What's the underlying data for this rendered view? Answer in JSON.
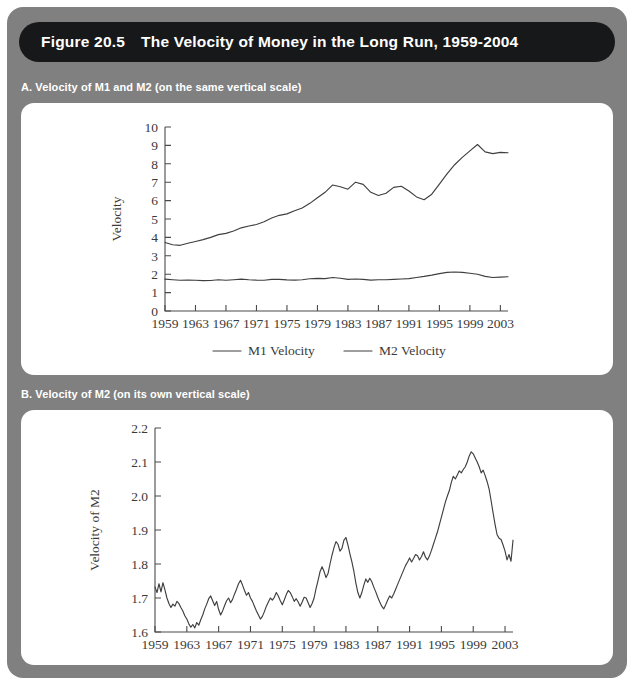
{
  "figure": {
    "number": "Figure 20.5",
    "title": "The Velocity of Money in the Long Run, 1959-2004",
    "panel_a_caption": "A. Velocity of M1 and M2 (on the same vertical scale)",
    "panel_b_caption": "B. Velocity of M2 (on its own vertical scale)",
    "colors": {
      "card_background": "#808080",
      "title_bar": "#16181a",
      "panel_background": "#ffffff",
      "line": "#3f3f3f",
      "caption_text": "#ffffff"
    }
  },
  "chart_data": [
    {
      "type": "line",
      "id": "panel-a",
      "title": "A. Velocity of M1 and M2 (on the same vertical scale)",
      "xlabel": "",
      "ylabel": "Velocity",
      "xlim": [
        1959,
        2004
      ],
      "ylim": [
        0,
        10
      ],
      "grid": false,
      "legend_position": "bottom",
      "xticks": [
        1959,
        1963,
        1967,
        1971,
        1975,
        1979,
        1983,
        1987,
        1991,
        1995,
        1999,
        2003
      ],
      "yticks": [
        0,
        1,
        2,
        3,
        4,
        5,
        6,
        7,
        8,
        9,
        10
      ],
      "x": [
        1959,
        1960,
        1961,
        1962,
        1963,
        1964,
        1965,
        1966,
        1967,
        1968,
        1969,
        1970,
        1971,
        1972,
        1973,
        1974,
        1975,
        1976,
        1977,
        1978,
        1979,
        1980,
        1981,
        1982,
        1983,
        1984,
        1985,
        1986,
        1987,
        1988,
        1989,
        1990,
        1991,
        1992,
        1993,
        1994,
        1995,
        1996,
        1997,
        1998,
        1999,
        2000,
        2001,
        2002,
        2003,
        2004
      ],
      "series": [
        {
          "name": "M1 Velocity",
          "values": [
            3.72,
            3.6,
            3.57,
            3.68,
            3.78,
            3.88,
            4.0,
            4.15,
            4.22,
            4.35,
            4.52,
            4.62,
            4.7,
            4.85,
            5.05,
            5.2,
            5.28,
            5.45,
            5.6,
            5.85,
            6.15,
            6.45,
            6.85,
            6.75,
            6.62,
            7.0,
            6.88,
            6.45,
            6.28,
            6.4,
            6.72,
            6.78,
            6.52,
            6.2,
            6.05,
            6.35,
            6.9,
            7.45,
            7.95,
            8.35,
            8.7,
            9.05,
            8.65,
            8.55,
            8.62,
            8.6
          ]
        },
        {
          "name": "M2 Velocity",
          "values": [
            1.73,
            1.7,
            1.67,
            1.68,
            1.67,
            1.65,
            1.66,
            1.7,
            1.67,
            1.7,
            1.73,
            1.7,
            1.68,
            1.67,
            1.72,
            1.72,
            1.69,
            1.68,
            1.7,
            1.75,
            1.77,
            1.76,
            1.82,
            1.78,
            1.72,
            1.74,
            1.72,
            1.68,
            1.7,
            1.7,
            1.72,
            1.74,
            1.76,
            1.82,
            1.88,
            1.95,
            2.03,
            2.1,
            2.12,
            2.1,
            2.05,
            2.0,
            1.88,
            1.82,
            1.84,
            1.86
          ]
        }
      ]
    },
    {
      "type": "line",
      "id": "panel-b",
      "title": "B. Velocity of M2 (on its own vertical scale)",
      "xlabel": "",
      "ylabel": "Velocity of M2",
      "xlim": [
        1959,
        2004
      ],
      "ylim": [
        1.6,
        2.2
      ],
      "grid": false,
      "legend_position": "none",
      "xticks": [
        1959,
        1963,
        1967,
        1971,
        1975,
        1979,
        1983,
        1987,
        1991,
        1995,
        1999,
        2003
      ],
      "yticks": [
        "1.6",
        "1.7",
        "1.8",
        "1.9",
        "2.0",
        "2.1",
        "2.2"
      ],
      "x": [
        1959.0,
        1959.25,
        1959.5,
        1959.75,
        1960.0,
        1960.25,
        1960.5,
        1960.75,
        1961.0,
        1961.25,
        1961.5,
        1961.75,
        1962.0,
        1962.25,
        1962.5,
        1962.75,
        1963.0,
        1963.25,
        1963.5,
        1963.75,
        1964.0,
        1964.25,
        1964.5,
        1964.75,
        1965.0,
        1965.25,
        1965.5,
        1965.75,
        1966.0,
        1966.25,
        1966.5,
        1966.75,
        1967.0,
        1967.25,
        1967.5,
        1967.75,
        1968.0,
        1968.25,
        1968.5,
        1968.75,
        1969.0,
        1969.25,
        1969.5,
        1969.75,
        1970.0,
        1970.25,
        1970.5,
        1970.75,
        1971.0,
        1971.25,
        1971.5,
        1971.75,
        1972.0,
        1972.25,
        1972.5,
        1972.75,
        1973.0,
        1973.25,
        1973.5,
        1973.75,
        1974.0,
        1974.25,
        1974.5,
        1974.75,
        1975.0,
        1975.25,
        1975.5,
        1975.75,
        1976.0,
        1976.25,
        1976.5,
        1976.75,
        1977.0,
        1977.25,
        1977.5,
        1977.75,
        1978.0,
        1978.25,
        1978.5,
        1978.75,
        1979.0,
        1979.25,
        1979.5,
        1979.75,
        1980.0,
        1980.25,
        1980.5,
        1980.75,
        1981.0,
        1981.25,
        1981.5,
        1981.75,
        1982.0,
        1982.25,
        1982.5,
        1982.75,
        1983.0,
        1983.25,
        1983.5,
        1983.75,
        1984.0,
        1984.25,
        1984.5,
        1984.75,
        1985.0,
        1985.25,
        1985.5,
        1985.75,
        1986.0,
        1986.25,
        1986.5,
        1986.75,
        1987.0,
        1987.25,
        1987.5,
        1987.75,
        1988.0,
        1988.25,
        1988.5,
        1988.75,
        1989.0,
        1989.25,
        1989.5,
        1989.75,
        1990.0,
        1990.25,
        1990.5,
        1990.75,
        1991.0,
        1991.25,
        1991.5,
        1991.75,
        1992.0,
        1992.25,
        1992.5,
        1992.75,
        1993.0,
        1993.25,
        1993.5,
        1993.75,
        1994.0,
        1994.25,
        1994.5,
        1994.75,
        1995.0,
        1995.25,
        1995.5,
        1995.75,
        1996.0,
        1996.25,
        1996.5,
        1996.75,
        1997.0,
        1997.25,
        1997.5,
        1997.75,
        1998.0,
        1998.25,
        1998.5,
        1998.75,
        1999.0,
        1999.25,
        1999.5,
        1999.75,
        2000.0,
        2000.25,
        2000.5,
        2000.75,
        2001.0,
        2001.25,
        2001.5,
        2001.75,
        2002.0,
        2002.25,
        2002.5,
        2002.75,
        2003.0,
        2003.25,
        2003.5,
        2003.75,
        2004.0
      ],
      "series": [
        {
          "name": "Velocity of M2",
          "values": [
            1.732,
            1.716,
            1.742,
            1.718,
            1.745,
            1.724,
            1.7,
            1.684,
            1.672,
            1.682,
            1.676,
            1.69,
            1.684,
            1.672,
            1.662,
            1.648,
            1.638,
            1.624,
            1.614,
            1.622,
            1.612,
            1.628,
            1.62,
            1.636,
            1.65,
            1.668,
            1.682,
            1.698,
            1.706,
            1.692,
            1.678,
            1.69,
            1.666,
            1.65,
            1.662,
            1.678,
            1.692,
            1.7,
            1.686,
            1.696,
            1.712,
            1.726,
            1.742,
            1.752,
            1.738,
            1.722,
            1.708,
            1.716,
            1.7,
            1.69,
            1.676,
            1.662,
            1.65,
            1.638,
            1.646,
            1.66,
            1.676,
            1.688,
            1.7,
            1.694,
            1.702,
            1.716,
            1.706,
            1.692,
            1.68,
            1.694,
            1.71,
            1.722,
            1.716,
            1.704,
            1.69,
            1.698,
            1.688,
            1.676,
            1.688,
            1.702,
            1.7,
            1.686,
            1.672,
            1.684,
            1.7,
            1.728,
            1.752,
            1.778,
            1.792,
            1.778,
            1.76,
            1.772,
            1.8,
            1.826,
            1.848,
            1.866,
            1.858,
            1.838,
            1.846,
            1.87,
            1.878,
            1.856,
            1.83,
            1.806,
            1.778,
            1.744,
            1.716,
            1.7,
            1.716,
            1.738,
            1.756,
            1.746,
            1.758,
            1.748,
            1.732,
            1.718,
            1.702,
            1.688,
            1.676,
            1.668,
            1.68,
            1.694,
            1.706,
            1.7,
            1.712,
            1.726,
            1.74,
            1.754,
            1.768,
            1.782,
            1.796,
            1.806,
            1.818,
            1.806,
            1.816,
            1.828,
            1.824,
            1.812,
            1.822,
            1.836,
            1.82,
            1.812,
            1.824,
            1.84,
            1.858,
            1.876,
            1.894,
            1.916,
            1.938,
            1.96,
            1.982,
            2.0,
            2.016,
            2.04,
            2.058,
            2.05,
            2.062,
            2.074,
            2.068,
            2.078,
            2.086,
            2.1,
            2.118,
            2.13,
            2.124,
            2.112,
            2.1,
            2.086,
            2.068,
            2.076,
            2.06,
            2.042,
            2.02,
            1.986,
            1.95,
            1.916,
            1.886,
            1.876,
            1.872,
            1.856,
            1.838,
            1.812,
            1.828,
            1.808,
            1.87
          ]
        }
      ]
    }
  ],
  "panel_a": {
    "legend": [
      {
        "label": "M1 Velocity"
      },
      {
        "label": "M2 Velocity"
      }
    ]
  }
}
